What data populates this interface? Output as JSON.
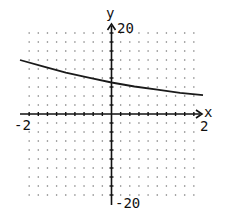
{
  "chart_data": {
    "type": "line",
    "title": "",
    "xlabel": "x",
    "ylabel": "y",
    "xlim": [
      -2,
      2
    ],
    "ylim": [
      -20,
      20
    ],
    "x_tick_labels": [
      "-2",
      "2"
    ],
    "y_tick_labels": [
      "20",
      "-20"
    ],
    "grid": "dotted",
    "grid_step_x": 0.2,
    "grid_step_y": 2,
    "legend": null,
    "series": [
      {
        "name": "curve",
        "x": [
          -2,
          -1.5,
          -1,
          -0.5,
          0,
          0.5,
          1,
          1.5,
          2
        ],
        "y": [
          12,
          10.6,
          9.2,
          8.1,
          7,
          6.1,
          5.4,
          4.7,
          4.2
        ]
      }
    ]
  },
  "labels": {
    "x_axis": "x",
    "y_axis": "y",
    "x_min": "-2",
    "x_max": "2",
    "y_max": "20",
    "y_min": "-20"
  },
  "colors": {
    "axis": "#111111",
    "curve": "#1a1a1a",
    "grid_dot": "#777777"
  }
}
